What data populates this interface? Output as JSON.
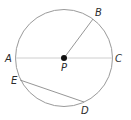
{
  "diagram": {
    "type": "circle-geometry",
    "colors": {
      "circle": "#9a9a9a",
      "diameter": "#c8c8c8",
      "segment": "#8a8a8a",
      "center_dot": "#111111",
      "label": "#2b2b2b"
    },
    "circle": {
      "cx": 64,
      "cy": 58,
      "r": 48.5
    },
    "points": {
      "A": {
        "label": "A",
        "x": 15.5,
        "y": 58,
        "lx": 5,
        "ly": 62
      },
      "B": {
        "label": "B",
        "x": 93,
        "y": 19,
        "lx": 95,
        "ly": 16
      },
      "C": {
        "label": "C",
        "x": 112.5,
        "y": 58,
        "lx": 115,
        "ly": 62
      },
      "P": {
        "label": "P",
        "x": 64,
        "y": 58,
        "lx": 61,
        "ly": 71
      },
      "E": {
        "label": "E",
        "x": 20,
        "y": 80,
        "lx": 11,
        "ly": 84
      },
      "D": {
        "label": "D",
        "x": 84,
        "y": 102,
        "lx": 81,
        "ly": 114
      }
    },
    "segments": [
      {
        "name": "diameter-AC",
        "from": "A",
        "to": "C"
      },
      {
        "name": "radius-PB",
        "from": "P",
        "to": "B"
      },
      {
        "name": "chord-ED",
        "from": "E",
        "to": "D"
      }
    ]
  }
}
